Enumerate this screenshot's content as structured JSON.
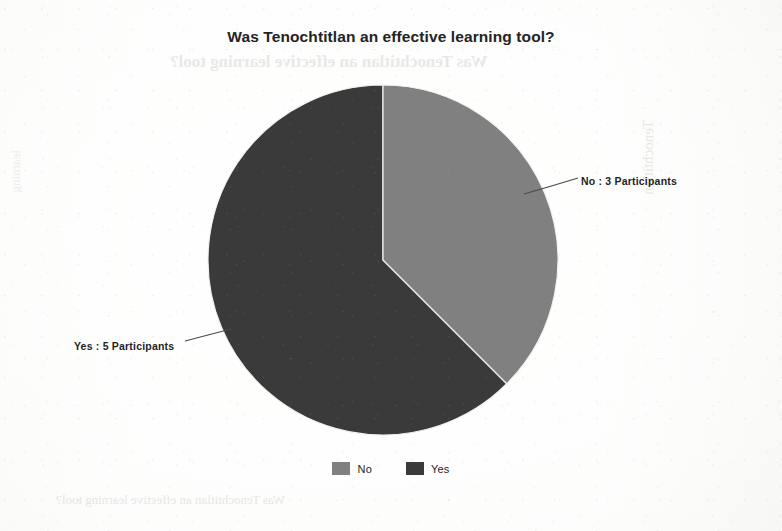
{
  "chart_data": {
    "type": "pie",
    "title": "Was Tenochtitlan an effective learning tool?",
    "categories": [
      "No",
      "Yes"
    ],
    "values": [
      3,
      5
    ],
    "total": 8,
    "unit": "Participants",
    "start_angle_deg": 0,
    "direction": "clockwise",
    "slices": [
      {
        "name": "No",
        "value": 3,
        "label": "No : 3 Participants",
        "percent": 37.5,
        "angle_deg": 135,
        "color": "#808080"
      },
      {
        "name": "Yes",
        "value": 5,
        "label": "Yes : 5 Participants",
        "percent": 62.5,
        "angle_deg": 225,
        "color": "#3a3a3a"
      }
    ],
    "legend": {
      "position": "bottom",
      "entries": [
        {
          "label": "No",
          "color": "#808080"
        },
        {
          "label": "Yes",
          "color": "#3a3a3a"
        }
      ]
    },
    "xlabel": "",
    "ylabel": "",
    "grid": false
  },
  "geometry": {
    "center_x": 383,
    "center_y": 260,
    "radius": 175
  },
  "colors": {
    "no_slice": "#808080",
    "yes_slice": "#3a3a3a",
    "title_text": "#232323",
    "label_text": "#1f1f1f",
    "leader_line": "#4a4a4a",
    "paper": "#fdfdfc"
  },
  "artifacts": {
    "ghost_top": "Was Tenochtitlan an effective learning tool?",
    "ghost_bottom": "Was Tenochtitlan an effective learning tool?",
    "ghost_right": "Tenochtitlan",
    "ghost_left": "learning"
  }
}
